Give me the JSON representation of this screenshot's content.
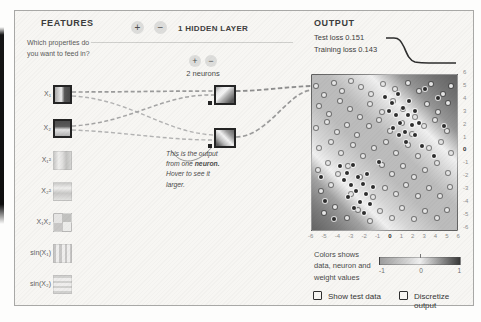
{
  "features": {
    "title": "FEATURES",
    "intro": "Which properties do you want to feed in?",
    "items": [
      {
        "label": "X₁",
        "active": true
      },
      {
        "label": "X₂",
        "active": true
      },
      {
        "label": "X₁²",
        "active": false
      },
      {
        "label": "X₂²",
        "active": false
      },
      {
        "label": "X₁X₂",
        "active": false
      },
      {
        "label": "sin(X₁)",
        "active": false
      },
      {
        "label": "sin(X₂)",
        "active": false
      }
    ]
  },
  "hidden_layer": {
    "plus_label": "+",
    "minus_label": "−",
    "layer_title": "1 HIDDEN LAYER",
    "neuron_plus_label": "+",
    "neuron_minus_label": "−",
    "neurons_label": "2 neurons",
    "callout": {
      "line1": "This is the output",
      "line2_pre": "from one ",
      "line2_bold": "neuron.",
      "line3": "Hover to see it",
      "line4": "larger."
    }
  },
  "output": {
    "title": "OUTPUT",
    "test_loss_label": "Test loss",
    "test_loss_value": "0.151",
    "training_loss_label": "Training loss",
    "training_loss_value": "0.143",
    "x_ticks": [
      "-6",
      "-5",
      "-4",
      "-3",
      "-2",
      "-1",
      "0",
      "1",
      "2",
      "3",
      "4",
      "5",
      "6"
    ],
    "y_ticks": [
      "6",
      "5",
      "4",
      "3",
      "2",
      "1",
      "0",
      "-1",
      "-2",
      "-3",
      "-4",
      "-5",
      "-6"
    ],
    "legend_text": "Colors shows data, neuron and weight values",
    "scale_labels": [
      "-1",
      "0",
      "1"
    ],
    "checkbox_show_test": "Show test data",
    "checkbox_discretize": "Discretize output",
    "heatmap": {
      "points": {
        "light": [
          [
            3,
            7
          ],
          [
            8,
            13
          ],
          [
            15,
            5
          ],
          [
            21,
            10
          ],
          [
            27,
            4
          ],
          [
            34,
            8
          ],
          [
            41,
            12
          ],
          [
            49,
            6
          ],
          [
            57,
            9
          ],
          [
            66,
            5
          ],
          [
            74,
            10
          ],
          [
            82,
            6
          ],
          [
            90,
            12
          ],
          [
            96,
            7
          ],
          [
            5,
            20
          ],
          [
            12,
            25
          ],
          [
            19,
            17
          ],
          [
            26,
            22
          ],
          [
            33,
            27
          ],
          [
            40,
            19
          ],
          [
            48,
            24
          ],
          [
            56,
            17
          ],
          [
            63,
            22
          ],
          [
            71,
            27
          ],
          [
            79,
            19
          ],
          [
            87,
            24
          ],
          [
            94,
            18
          ],
          [
            3,
            34
          ],
          [
            10,
            30
          ],
          [
            17,
            37
          ],
          [
            24,
            32
          ],
          [
            31,
            39
          ],
          [
            39,
            33
          ],
          [
            46,
            29
          ],
          [
            54,
            36
          ],
          [
            62,
            31
          ],
          [
            69,
            38
          ],
          [
            77,
            33
          ],
          [
            85,
            29
          ],
          [
            93,
            36
          ],
          [
            5,
            47
          ],
          [
            13,
            43
          ],
          [
            20,
            50
          ],
          [
            28,
            45
          ],
          [
            35,
            52
          ],
          [
            43,
            47
          ],
          [
            51,
            43
          ],
          [
            58,
            50
          ],
          [
            66,
            45
          ],
          [
            73,
            52
          ],
          [
            81,
            47
          ],
          [
            89,
            43
          ],
          [
            96,
            50
          ],
          [
            4,
            61
          ],
          [
            11,
            57
          ],
          [
            18,
            64
          ],
          [
            25,
            59
          ],
          [
            33,
            66
          ],
          [
            48,
            58
          ],
          [
            55,
            64
          ],
          [
            63,
            59
          ],
          [
            70,
            66
          ],
          [
            78,
            61
          ],
          [
            86,
            57
          ],
          [
            94,
            63
          ],
          [
            6,
            75
          ],
          [
            13,
            71
          ],
          [
            27,
            77
          ],
          [
            42,
            79
          ],
          [
            50,
            73
          ],
          [
            58,
            77
          ],
          [
            65,
            71
          ],
          [
            73,
            78
          ],
          [
            81,
            73
          ],
          [
            88,
            78
          ],
          [
            95,
            72
          ],
          [
            8,
            89
          ],
          [
            16,
            85
          ],
          [
            24,
            92
          ],
          [
            32,
            87
          ],
          [
            40,
            94
          ],
          [
            47,
            88
          ],
          [
            55,
            92
          ],
          [
            62,
            86
          ],
          [
            70,
            93
          ],
          [
            78,
            88
          ],
          [
            86,
            92
          ],
          [
            93,
            87
          ]
        ],
        "dark": [
          [
            50,
            14
          ],
          [
            55,
            18
          ],
          [
            59,
            12
          ],
          [
            63,
            21
          ],
          [
            58,
            26
          ],
          [
            53,
            23
          ],
          [
            61,
            31
          ],
          [
            66,
            26
          ],
          [
            56,
            34
          ],
          [
            64,
            37
          ],
          [
            69,
            32
          ],
          [
            60,
            39
          ],
          [
            67,
            17
          ],
          [
            71,
            23
          ],
          [
            65,
            43
          ],
          [
            71,
            39
          ],
          [
            74,
            31
          ],
          [
            78,
            9
          ],
          [
            87,
            15
          ],
          [
            91,
            33
          ],
          [
            84,
            52
          ],
          [
            76,
            46
          ],
          [
            19,
            59
          ],
          [
            24,
            63
          ],
          [
            28,
            58
          ],
          [
            32,
            66
          ],
          [
            27,
            71
          ],
          [
            22,
            68
          ],
          [
            30,
            75
          ],
          [
            35,
            70
          ],
          [
            25,
            79
          ],
          [
            33,
            82
          ],
          [
            37,
            77
          ],
          [
            29,
            86
          ],
          [
            36,
            89
          ],
          [
            40,
            83
          ],
          [
            42,
            72
          ],
          [
            38,
            64
          ],
          [
            9,
            81
          ],
          [
            15,
            93
          ],
          [
            46,
            56
          ],
          [
            6,
            66
          ]
        ]
      }
    }
  },
  "colors": {
    "heat_dark": "#646464",
    "heat_mid": "#bcbcbc",
    "heat_light": "#f0f0f0",
    "point_dark": "#2d2d2d",
    "point_light": "#e7e7e7"
  }
}
